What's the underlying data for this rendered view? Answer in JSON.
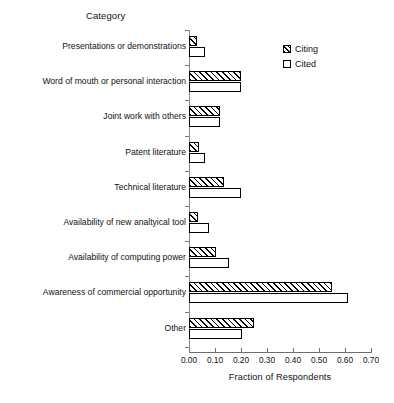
{
  "chart_data": {
    "type": "bar",
    "orientation": "horizontal",
    "title": "",
    "ylabel": "Category",
    "xlabel": "Fraction of Respondents",
    "xlim": [
      0.0,
      0.7
    ],
    "xticks": [
      "0.00",
      "0.10",
      "0.20",
      "0.30",
      "0.40",
      "0.50",
      "0.60",
      "0.70"
    ],
    "grid": false,
    "legend_position": "top-right",
    "categories": [
      "Presentations or demonstrations",
      "Word of mouth or personal interaction",
      "Joint work with others",
      "Patent literature",
      "Technical literature",
      "Availability of new analtyical tool",
      "Availability of computing power",
      "Awareness of commercial opportunity",
      "Other"
    ],
    "series": [
      {
        "name": "Citing",
        "fill": "hatched",
        "values": [
          0.03,
          0.2,
          0.12,
          0.04,
          0.135,
          0.035,
          0.105,
          0.55,
          0.25
        ]
      },
      {
        "name": "Cited",
        "fill": "white",
        "values": [
          0.06,
          0.2,
          0.12,
          0.06,
          0.2,
          0.075,
          0.155,
          0.61,
          0.205
        ]
      }
    ]
  },
  "colors": {
    "bar_outline": "#000000",
    "bar_fill_cited": "#ffffff",
    "axis": "#6f6f6f",
    "text": "#111111"
  }
}
